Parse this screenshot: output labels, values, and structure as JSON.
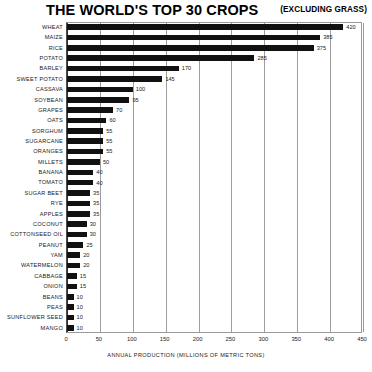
{
  "header": {
    "title": "THE WORLD'S TOP 30 CROPS",
    "note": "(EXCLUDING GRASS)"
  },
  "chart_data": {
    "type": "bar",
    "orientation": "horizontal",
    "title": "THE WORLD'S TOP 30 CROPS",
    "subtitle": "(EXCLUDING GRASS)",
    "xlabel": "ANNUAL PRODUCTION (MILLIONS OF METRIC TONS)",
    "ylabel": "",
    "xlim": [
      0,
      450
    ],
    "xticks": [
      0,
      50,
      100,
      150,
      200,
      250,
      300,
      350,
      400,
      450
    ],
    "grid": "vertical",
    "legend": "none",
    "bar_color": "#111111",
    "categories": [
      "WHEAT",
      "MAIZE",
      "RICE",
      "POTATO",
      "BARLEY",
      "SWEET POTATO",
      "CASSAVA",
      "SOYBEAN",
      "GRAPES",
      "OATS",
      "SORGHUM",
      "SUGARCANE",
      "ORANGES",
      "MILLETS",
      "BANANA",
      "TOMATO",
      "SUGAR BEET",
      "RYE",
      "APPLES",
      "COCONUT",
      "COTTONSEED OIL",
      "PEANUT",
      "YAM",
      "WATERMELON",
      "CABBAGE",
      "ONION",
      "BEANS",
      "PEAS",
      "SUNFLOWER SEED",
      "MANGO"
    ],
    "values": [
      420,
      385,
      375,
      285,
      170,
      145,
      100,
      95,
      70,
      60,
      55,
      55,
      55,
      50,
      40,
      40,
      35,
      35,
      35,
      30,
      30,
      25,
      20,
      20,
      15,
      15,
      10,
      10,
      10,
      10
    ]
  }
}
